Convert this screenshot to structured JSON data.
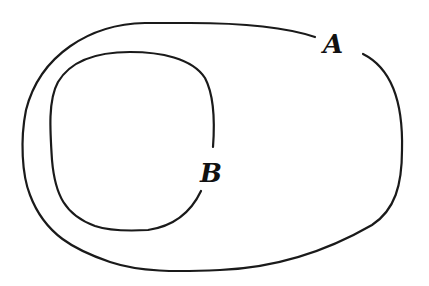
{
  "diagram": {
    "type": "nested-closed-curves",
    "curves": [
      {
        "id": "outer",
        "label": "A",
        "description": "outer closed curve with a gap at top-right where label A sits"
      },
      {
        "id": "inner",
        "label": "B",
        "description": "inner closed curve with a gap on its right side where label B sits"
      }
    ],
    "labels": {
      "a": "A",
      "b": "B"
    },
    "colors": {
      "stroke": "#1a1a1a",
      "background": "#ffffff"
    }
  }
}
